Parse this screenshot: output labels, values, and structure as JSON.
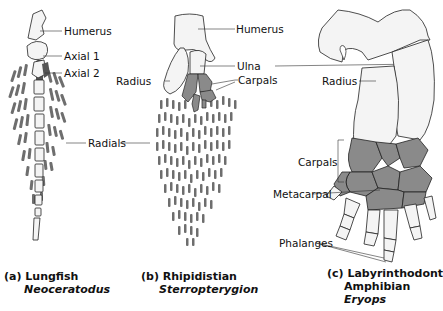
{
  "figure": {
    "panels": [
      {
        "id": "a",
        "caption": "(a) Lungfish",
        "genus": "Neoceratodus",
        "labels": [
          "Humerus",
          "Axial 1",
          "Axial 2",
          "Radials"
        ]
      },
      {
        "id": "b",
        "caption": "(b) Rhipidistian",
        "genus": "Sterropterygion",
        "labels": [
          "Humerus",
          "Radius",
          "Ulna",
          "Carpals"
        ]
      },
      {
        "id": "c",
        "caption": "(c) Labyrinthodont",
        "caption_line2": "Amphibian",
        "genus": "Eryops",
        "labels": [
          "Radius",
          "Carpals",
          "Metacarpal",
          "Phalanges"
        ]
      }
    ],
    "colors": {
      "bone_fill": "#f4f4f4",
      "carpal_fill": "#8a8a8a",
      "radial_fill": "#6e6e6e",
      "outline": "#222222"
    }
  }
}
